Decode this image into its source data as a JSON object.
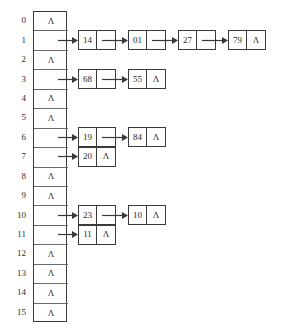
{
  "figure": {
    "kind": "hash-table-separate-chaining-diagram",
    "null_symbol": "Λ",
    "table": {
      "index_labels": [
        "0",
        "1",
        "2",
        "3",
        "4",
        "5",
        "6",
        "7",
        "8",
        "9",
        "10",
        "11",
        "12",
        "13",
        "14",
        "15"
      ],
      "buckets": [
        {
          "index": "0",
          "empty": true,
          "cell_text": "Λ"
        },
        {
          "index": "1",
          "empty": false,
          "cell_text": ""
        },
        {
          "index": "2",
          "empty": true,
          "cell_text": "Λ"
        },
        {
          "index": "3",
          "empty": false,
          "cell_text": ""
        },
        {
          "index": "4",
          "empty": true,
          "cell_text": "Λ"
        },
        {
          "index": "5",
          "empty": true,
          "cell_text": "Λ"
        },
        {
          "index": "6",
          "empty": false,
          "cell_text": ""
        },
        {
          "index": "7",
          "empty": false,
          "cell_text": ""
        },
        {
          "index": "8",
          "empty": true,
          "cell_text": "Λ"
        },
        {
          "index": "9",
          "empty": true,
          "cell_text": "Λ"
        },
        {
          "index": "10",
          "empty": false,
          "cell_text": ""
        },
        {
          "index": "11",
          "empty": false,
          "cell_text": ""
        },
        {
          "index": "12",
          "empty": true,
          "cell_text": "Λ"
        },
        {
          "index": "13",
          "empty": true,
          "cell_text": "Λ"
        },
        {
          "index": "14",
          "empty": true,
          "cell_text": "Λ"
        },
        {
          "index": "15",
          "empty": true,
          "cell_text": "Λ"
        }
      ]
    },
    "chains": [
      {
        "bucket": "1",
        "nodes": [
          {
            "key": "14",
            "next": ""
          },
          {
            "key": "01",
            "next": ""
          },
          {
            "key": "27",
            "next": ""
          },
          {
            "key": "79",
            "next": "Λ"
          }
        ]
      },
      {
        "bucket": "3",
        "nodes": [
          {
            "key": "68",
            "next": ""
          },
          {
            "key": "55",
            "next": "Λ"
          }
        ]
      },
      {
        "bucket": "6",
        "nodes": [
          {
            "key": "19",
            "next": ""
          },
          {
            "key": "84",
            "next": "Λ"
          }
        ]
      },
      {
        "bucket": "7",
        "nodes": [
          {
            "key": "20",
            "next": "Λ"
          }
        ]
      },
      {
        "bucket": "10",
        "nodes": [
          {
            "key": "23",
            "next": ""
          },
          {
            "key": "10",
            "next": "Λ"
          }
        ]
      },
      {
        "bucket": "11",
        "nodes": [
          {
            "key": "11",
            "next": "Λ"
          }
        ]
      }
    ],
    "colors": {
      "background": "#ffffff",
      "stroke": "#3a3a3a",
      "cell_divider": "#6b6b6b",
      "text": "#1f1f1f"
    }
  }
}
